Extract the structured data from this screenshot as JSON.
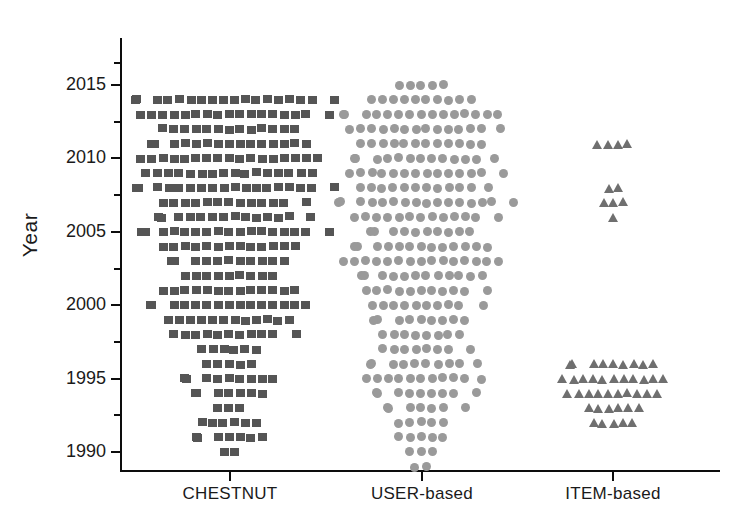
{
  "chart_data": {
    "type": "scatter",
    "plot_style": "dot-strip-plot",
    "title": "",
    "xlabel": "",
    "ylabel": "Year",
    "categories": [
      "CHESTNUT",
      "USER-based",
      "ITEM-based"
    ],
    "ylim": [
      1988,
      2017
    ],
    "ytick_labels": [
      "1990",
      "1995",
      "2000",
      "2005",
      "2010",
      "2015"
    ],
    "ytick_values": [
      1990,
      1995,
      2000,
      2005,
      2010,
      2015
    ],
    "yminor_tick_values": [
      1992.5,
      1997.5,
      2002.5,
      2007.5,
      2012.5,
      2016.5
    ],
    "grid": false,
    "legend": "none",
    "series": [
      {
        "name": "CHESTNUT",
        "marker": "square",
        "color": "#555555",
        "x_center": 230,
        "counts_by_year": {
          "2014": 18,
          "2013": 17,
          "2012": 13,
          "2011": 15,
          "2010": 17,
          "2009": 16,
          "2008": 18,
          "2007": 13,
          "2006": 14,
          "2005": 17,
          "2004": 13,
          "2003": 11,
          "2002": 9,
          "2001": 13,
          "2000": 15,
          "1999": 12,
          "1998": 11,
          "1997": 6,
          "1996": 5,
          "1995": 9,
          "1994": 7,
          "1993": 3,
          "1992": 6,
          "1991": 7,
          "1990": 2
        }
      },
      {
        "name": "USER-based",
        "marker": "circle",
        "color": "#9a9a9a",
        "x_center": 422,
        "counts_by_year": {
          "2015": 5,
          "2014": 10,
          "2013": 15,
          "2012": 14,
          "2011": 12,
          "2010": 13,
          "2009": 14,
          "2008": 12,
          "2007": 16,
          "2006": 13,
          "2005": 10,
          "2004": 13,
          "2003": 15,
          "2002": 12,
          "2001": 11,
          "2000": 10,
          "1999": 9,
          "1998": 8,
          "1997": 8,
          "1996": 10,
          "1995": 11,
          "1994": 9,
          "1993": 7,
          "1992": 5,
          "1991": 5,
          "1990": 3,
          "1989": 2
        }
      },
      {
        "name": "ITEM-based",
        "marker": "triangle",
        "color": "#6f6f6f",
        "x_center": 613,
        "counts_by_year": {
          "2011": 4,
          "2008": 2,
          "2007": 3,
          "2006": 1,
          "1996": 9,
          "1995": 11,
          "1994": 10,
          "1993": 6,
          "1992": 5
        }
      }
    ]
  },
  "axes": {
    "y_label_text": "Year",
    "x_labels": [
      "CHESTNUT",
      "USER-based",
      "ITEM-based"
    ]
  }
}
